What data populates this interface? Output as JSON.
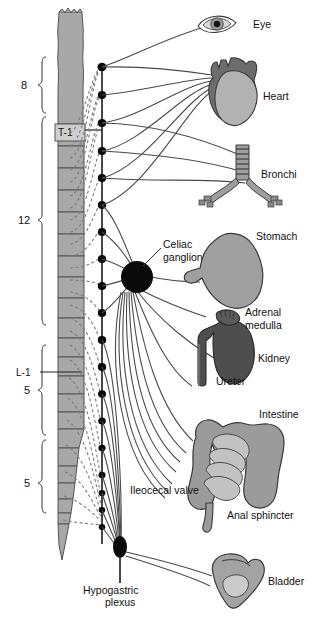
{
  "figure": {
    "background": "#ffffff"
  },
  "colors": {
    "cord_fill": "#a8a8a8",
    "cord_stroke": "#555555",
    "nerve_line": "#4a4a4a",
    "dashed_line": "#7d7d7d",
    "ganglion": "#000000",
    "organ_light": "#b0b0b0",
    "organ_mid": "#8f8f8f",
    "organ_dark": "#4e4e4e",
    "text": "#111111"
  },
  "spine": {
    "segment_labels": [
      {
        "id": "t1",
        "text": "T-1"
      },
      {
        "id": "l1",
        "text": "L-1"
      }
    ],
    "brackets": [
      {
        "id": "cervical-thoracic-8",
        "count": "8"
      },
      {
        "id": "thoracic-12",
        "count": "12"
      },
      {
        "id": "lumbar-5",
        "count": "5"
      },
      {
        "id": "sacral-5",
        "count": "5"
      }
    ]
  },
  "ganglia": {
    "celiac": "Celiac\nganglion",
    "celiac_line1": "Celiac",
    "celiac_line2": "ganglion",
    "hypogastric_line1": "Hypogastric",
    "hypogastric_line2": "plexus"
  },
  "organs": [
    {
      "id": "eye",
      "label": "Eye"
    },
    {
      "id": "heart",
      "label": "Heart"
    },
    {
      "id": "bronchi",
      "label": "Bronchi"
    },
    {
      "id": "stomach",
      "label": "Stomach"
    },
    {
      "id": "adrenal-medulla-line1",
      "label": "Adrenal"
    },
    {
      "id": "adrenal-medulla-line2",
      "label": "medulla"
    },
    {
      "id": "kidney",
      "label": "Kidney"
    },
    {
      "id": "ureter",
      "label": "Ureter"
    },
    {
      "id": "intestine",
      "label": "Intestine"
    },
    {
      "id": "ileocecal-valve",
      "label": "Ileocecal valve"
    },
    {
      "id": "anal-sphincter",
      "label": "Anal sphincter"
    },
    {
      "id": "bladder",
      "label": "Bladder"
    }
  ]
}
